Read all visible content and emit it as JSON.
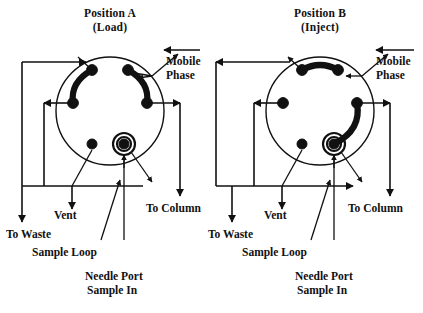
{
  "figure": {
    "background_color": "#ffffff",
    "line_color": "#111111",
    "width": 423,
    "height": 313
  },
  "panels": [
    {
      "id": "position-a",
      "title": "Position  A",
      "subtitle": "(Load)",
      "mobile_phase_label": "Mobile",
      "mobile_phase_label2": "Phase",
      "to_waste_label": "To  Waste",
      "vent_label": "Vent",
      "to_column_label": "To  Column",
      "sample_loop_label": "Sample  Loop",
      "needle_port_label": "Needle  Port",
      "sample_in_label": "Sample  In"
    },
    {
      "id": "position-b",
      "title": "Position  B",
      "subtitle": "(Inject)",
      "mobile_phase_label": "Mobile",
      "mobile_phase_label2": "Phase",
      "to_waste_label": "To  Waste",
      "vent_label": "Vent",
      "to_column_label": "To  Column",
      "sample_loop_label": "Sample  Loop",
      "needle_port_label": "Needle  Port",
      "sample_in_label": "Sample  In"
    }
  ],
  "footer": {
    "faint_caption": ""
  }
}
